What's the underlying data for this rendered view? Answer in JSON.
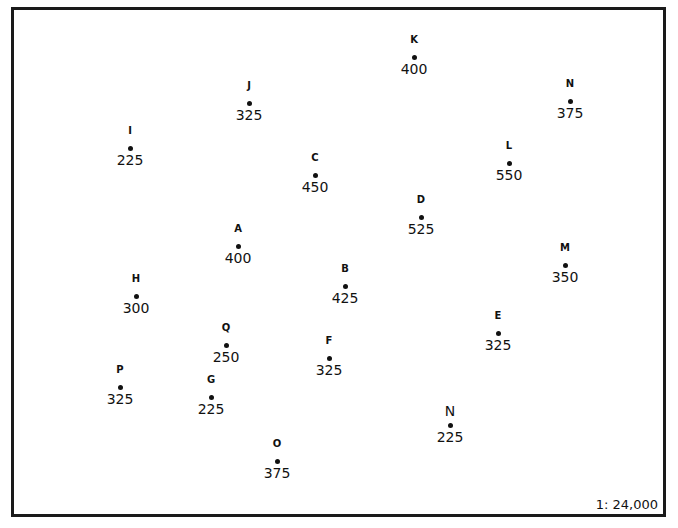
{
  "map": {
    "scale": "1: 24,000",
    "points": [
      {
        "label": "K",
        "value": "400",
        "x": 414,
        "y": 57
      },
      {
        "label": "J",
        "value": "325",
        "x": 249,
        "y": 103
      },
      {
        "label": "N",
        "value": "375",
        "x": 570,
        "y": 101
      },
      {
        "label": "I",
        "value": "225",
        "x": 130,
        "y": 148
      },
      {
        "label": "C",
        "value": "450",
        "x": 315,
        "y": 175
      },
      {
        "label": "L",
        "value": "550",
        "x": 509,
        "y": 163
      },
      {
        "label": "D",
        "value": "525",
        "x": 421,
        "y": 217
      },
      {
        "label": "A",
        "value": "400",
        "x": 238,
        "y": 246
      },
      {
        "label": "M",
        "value": "350",
        "x": 565,
        "y": 265
      },
      {
        "label": "H",
        "value": "300",
        "x": 136,
        "y": 296
      },
      {
        "label": "B",
        "value": "425",
        "x": 345,
        "y": 286
      },
      {
        "label": "E",
        "value": "325",
        "x": 498,
        "y": 333
      },
      {
        "label": "Q",
        "value": "250",
        "x": 226,
        "y": 345
      },
      {
        "label": "F",
        "value": "325",
        "x": 329,
        "y": 358
      },
      {
        "label": "P",
        "value": "325",
        "x": 120,
        "y": 387
      },
      {
        "label": "G",
        "value": "225",
        "x": 211,
        "y": 397
      },
      {
        "label": "N",
        "value": "225",
        "x": 450,
        "y": 425,
        "large_label": true
      },
      {
        "label": "O",
        "value": "375",
        "x": 277,
        "y": 461
      }
    ]
  }
}
